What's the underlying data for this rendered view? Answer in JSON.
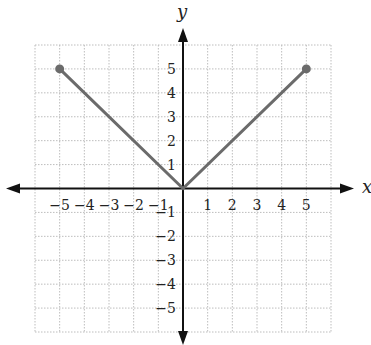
{
  "chart_data": {
    "type": "line",
    "title": "",
    "xlabel": "x",
    "ylabel": "y",
    "xlim": [
      -6,
      6
    ],
    "ylim": [
      -6,
      6
    ],
    "grid": true,
    "x_ticks": [
      -5,
      -4,
      -3,
      -2,
      -1,
      1,
      2,
      3,
      4,
      5
    ],
    "y_ticks": [
      5,
      4,
      3,
      2,
      1,
      -1,
      -2,
      -3,
      -4,
      -5
    ],
    "x_tick_labels": [
      "−5",
      "−4",
      "−3",
      "−2",
      "−1",
      "1",
      "2",
      "3",
      "4",
      "5"
    ],
    "y_tick_labels": [
      "5",
      "4",
      "3",
      "2",
      "1",
      "−1",
      "−2",
      "−3",
      "−4",
      "−5"
    ],
    "series": [
      {
        "name": "y = |x|",
        "x": [
          -5,
          0,
          5
        ],
        "y": [
          5,
          0,
          5
        ],
        "color": "#6b6b6b",
        "endpoints": [
          [
            -5,
            5
          ],
          [
            5,
            5
          ]
        ],
        "endpoint_style": "closed-dot"
      }
    ],
    "colors": {
      "axis": "#111111",
      "grid": "#bdbdbd",
      "line": "#6b6b6b"
    }
  }
}
